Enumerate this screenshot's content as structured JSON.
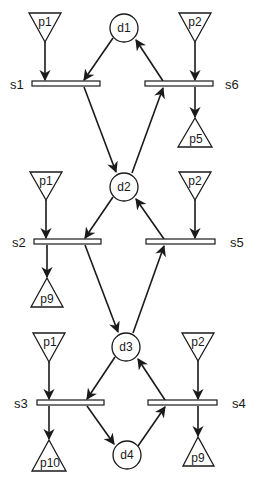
{
  "diagram": {
    "type": "petri-net",
    "colors": {
      "stroke": "#1a1a1a",
      "fill": "#ffffff"
    },
    "places_in": [
      {
        "id": "p1a",
        "label": "p1",
        "x": 45,
        "y_top": 13,
        "apex": 42
      },
      {
        "id": "p2a",
        "label": "p2",
        "x": 195,
        "y_top": 13,
        "apex": 42
      },
      {
        "id": "p1b",
        "label": "p1",
        "x": 46,
        "y_top": 172,
        "apex": 200
      },
      {
        "id": "p2b",
        "label": "p2",
        "x": 195,
        "y_top": 172,
        "apex": 200
      },
      {
        "id": "p1c",
        "label": "p1",
        "x": 49,
        "y_top": 333,
        "apex": 362
      },
      {
        "id": "p2c",
        "label": "p2",
        "x": 198,
        "y_top": 333,
        "apex": 361
      }
    ],
    "places_out": [
      {
        "id": "p5",
        "label": "p5",
        "x": 195,
        "apex": 118,
        "y_base": 147
      },
      {
        "id": "p9a",
        "label": "p9",
        "x": 47,
        "apex": 278,
        "y_base": 307
      },
      {
        "id": "p10",
        "label": "p10",
        "x": 49,
        "apex": 440,
        "y_base": 471
      },
      {
        "id": "p9b",
        "label": "p9",
        "x": 198,
        "apex": 437,
        "y_base": 466
      }
    ],
    "circles": [
      {
        "id": "d1",
        "label": "d1",
        "cx": 124,
        "cy": 28
      },
      {
        "id": "d2",
        "label": "d2",
        "cx": 124,
        "cy": 187
      },
      {
        "id": "d3",
        "label": "d3",
        "cx": 126,
        "cy": 347
      },
      {
        "id": "d4",
        "label": "d4",
        "cx": 127,
        "cy": 455
      }
    ],
    "transitions": [
      {
        "id": "s1",
        "label": "s1",
        "x1": 32,
        "x2": 100,
        "y": 84,
        "label_x": 10,
        "label_side": "left"
      },
      {
        "id": "s6",
        "label": "s6",
        "x1": 145,
        "x2": 213,
        "y": 84,
        "label_x": 225,
        "label_side": "right"
      },
      {
        "id": "s2",
        "label": "s2",
        "x1": 34,
        "x2": 101,
        "y": 242,
        "label_x": 12,
        "label_side": "left"
      },
      {
        "id": "s5",
        "label": "s5",
        "x1": 146,
        "x2": 215,
        "y": 242,
        "label_x": 230,
        "label_side": "right"
      },
      {
        "id": "s3",
        "label": "s3",
        "x1": 37,
        "x2": 104,
        "y": 403,
        "label_x": 14,
        "label_side": "left"
      },
      {
        "id": "s4",
        "label": "s4",
        "x1": 148,
        "x2": 217,
        "y": 403,
        "label_x": 232,
        "label_side": "right"
      }
    ]
  }
}
